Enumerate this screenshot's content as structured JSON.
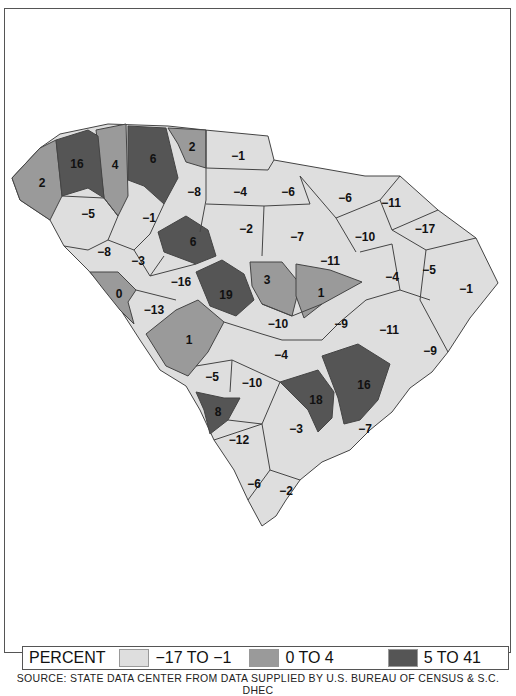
{
  "chart_data": {
    "type": "choropleth",
    "title": "",
    "region": "South Carolina counties",
    "legend_title": "PERCENT",
    "bins": [
      {
        "label": "-17 TO -1",
        "range": [
          -17,
          -1
        ],
        "color": "#dedede"
      },
      {
        "label": "0 TO 4",
        "range": [
          0,
          4
        ],
        "color": "#9a9a9a"
      },
      {
        "label": "5 TO 41",
        "range": [
          5,
          41
        ],
        "color": "#555555"
      }
    ],
    "county_values": [
      16,
      2,
      4,
      6,
      2,
      -1,
      -5,
      -8,
      -4,
      -6,
      -6,
      -11,
      -1,
      -8,
      -3,
      6,
      -2,
      -7,
      -10,
      -17,
      0,
      -16,
      19,
      3,
      -11,
      1,
      -4,
      -5,
      -1,
      -13,
      1,
      -10,
      -9,
      -11,
      -4,
      -9,
      -5,
      -10,
      18,
      16,
      8,
      -3,
      -7,
      -12,
      -6,
      -2
    ],
    "source": "SOURCE: STATE DATA CENTER FROM DATA SUPPLIED BY U.S. BUREAU OF CENSUS & S.C. DHEC"
  },
  "legend": {
    "title": "PERCENT",
    "items": [
      {
        "label": "−17 TO −1",
        "color": "#dedede"
      },
      {
        "label": "0 TO 4",
        "color": "#9a9a9a"
      },
      {
        "label": "5 TO 41",
        "color": "#555555"
      }
    ]
  },
  "labels": [
    {
      "v": "16",
      "x": 77,
      "y": 165
    },
    {
      "v": "2",
      "x": 42,
      "y": 184
    },
    {
      "v": "4",
      "x": 115,
      "y": 166
    },
    {
      "v": "6",
      "x": 153,
      "y": 160
    },
    {
      "v": "2",
      "x": 192,
      "y": 148
    },
    {
      "v": "−1",
      "x": 238,
      "y": 157
    },
    {
      "v": "−5",
      "x": 88,
      "y": 215
    },
    {
      "v": "−8",
      "x": 194,
      "y": 193
    },
    {
      "v": "−4",
      "x": 240,
      "y": 193
    },
    {
      "v": "−6",
      "x": 288,
      "y": 193
    },
    {
      "v": "−6",
      "x": 345,
      "y": 199
    },
    {
      "v": "−11",
      "x": 391,
      "y": 204
    },
    {
      "v": "−1",
      "x": 149,
      "y": 219
    },
    {
      "v": "−8",
      "x": 104,
      "y": 253
    },
    {
      "v": "−3",
      "x": 138,
      "y": 262
    },
    {
      "v": "6",
      "x": 193,
      "y": 243
    },
    {
      "v": "−2",
      "x": 246,
      "y": 230
    },
    {
      "v": "−7",
      "x": 297,
      "y": 238
    },
    {
      "v": "−10",
      "x": 365,
      "y": 238
    },
    {
      "v": "−17",
      "x": 425,
      "y": 230
    },
    {
      "v": "0",
      "x": 119,
      "y": 295
    },
    {
      "v": "−16",
      "x": 181,
      "y": 283
    },
    {
      "v": "19",
      "x": 226,
      "y": 296
    },
    {
      "v": "3",
      "x": 267,
      "y": 281
    },
    {
      "v": "−11",
      "x": 330,
      "y": 262
    },
    {
      "v": "1",
      "x": 321,
      "y": 294
    },
    {
      "v": "−4",
      "x": 392,
      "y": 278
    },
    {
      "v": "−5",
      "x": 429,
      "y": 271
    },
    {
      "v": "−1",
      "x": 466,
      "y": 290
    },
    {
      "v": "−13",
      "x": 154,
      "y": 311
    },
    {
      "v": "1",
      "x": 189,
      "y": 341
    },
    {
      "v": "−10",
      "x": 278,
      "y": 325
    },
    {
      "v": "−9",
      "x": 341,
      "y": 325
    },
    {
      "v": "−11",
      "x": 389,
      "y": 331
    },
    {
      "v": "−4",
      "x": 281,
      "y": 356
    },
    {
      "v": "−9",
      "x": 430,
      "y": 352
    },
    {
      "v": "−5",
      "x": 212,
      "y": 378
    },
    {
      "v": "−10",
      "x": 252,
      "y": 384
    },
    {
      "v": "18",
      "x": 316,
      "y": 401
    },
    {
      "v": "16",
      "x": 364,
      "y": 386
    },
    {
      "v": "8",
      "x": 218,
      "y": 413
    },
    {
      "v": "−3",
      "x": 296,
      "y": 430
    },
    {
      "v": "−7",
      "x": 365,
      "y": 430
    },
    {
      "v": "−12",
      "x": 239,
      "y": 441
    },
    {
      "v": "−6",
      "x": 254,
      "y": 485
    },
    {
      "v": "−2",
      "x": 286,
      "y": 492
    }
  ],
  "source": "SOURCE: STATE DATA CENTER FROM DATA SUPPLIED BY U.S. BUREAU OF CENSUS & S.C. DHEC"
}
